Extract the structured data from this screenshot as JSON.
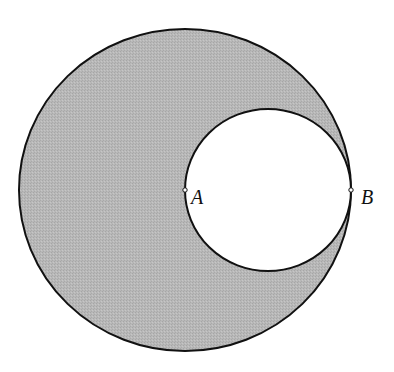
{
  "figure": {
    "colors": {
      "shade": "#b4b4b4",
      "stroke": "#111111",
      "background": "#ffffff"
    },
    "outer_circle": {
      "cx": 185,
      "cy": 190,
      "rx": 166,
      "ry": 161
    },
    "inner_circle": {
      "cx": 268,
      "cy": 190,
      "rx": 83,
      "ry": 81
    },
    "points": [
      {
        "label": "A",
        "x": 185,
        "y": 190
      },
      {
        "label": "B",
        "x": 351,
        "y": 190
      }
    ]
  }
}
